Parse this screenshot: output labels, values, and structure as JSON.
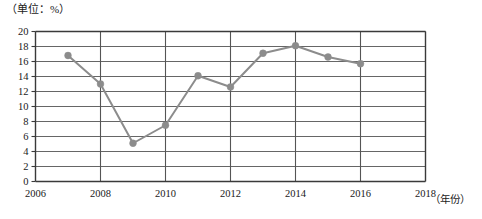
{
  "chart_data": {
    "type": "line",
    "title": "",
    "subtitle": "",
    "unit_note": "（单位：%）",
    "xlabel": "（年份）",
    "ylabel": "",
    "xlim": [
      2006,
      2018
    ],
    "ylim": [
      0,
      20
    ],
    "x_tick_step": 2,
    "y_tick_step": 2,
    "grid": true,
    "legend": "none",
    "marker": "circle",
    "series_color": "#8c8c8c",
    "grid_color": "#555555",
    "axis_color": "#3a3a3a",
    "x": [
      2007,
      2008,
      2009,
      2010,
      2011,
      2012,
      2013,
      2014,
      2015,
      2016
    ],
    "values": [
      16.8,
      13.0,
      5.1,
      7.5,
      14.1,
      12.6,
      17.1,
      18.1,
      16.6,
      15.7
    ],
    "categories": [
      "2007",
      "2008",
      "2009",
      "2010",
      "2011",
      "2012",
      "2013",
      "2014",
      "2015",
      "2016"
    ],
    "x_tick_labels": [
      "2006",
      "2008",
      "2010",
      "2012",
      "2014",
      "2016",
      "2018"
    ],
    "x_tick_values": [
      2006,
      2008,
      2010,
      2012,
      2014,
      2016,
      2018
    ],
    "y_tick_labels": [
      "0",
      "2",
      "4",
      "6",
      "8",
      "10",
      "12",
      "14",
      "16",
      "18",
      "20"
    ],
    "y_tick_values": [
      0,
      2,
      4,
      6,
      8,
      10,
      12,
      14,
      16,
      18,
      20
    ]
  }
}
